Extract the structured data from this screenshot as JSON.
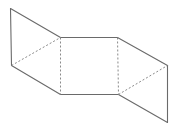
{
  "diagram": {
    "type": "folded-panels-3d",
    "width": 172,
    "height": 126,
    "colors": {
      "background": "#ffffff",
      "solid_stroke": "#6a6a6a",
      "dashed_stroke": "#8a8a8a"
    },
    "vertices": {
      "A": [
        10,
        8
      ],
      "B": [
        11,
        65
      ],
      "C": [
        60,
        37
      ],
      "D": [
        60,
        94
      ],
      "E": [
        117,
        37
      ],
      "F": [
        118,
        94
      ],
      "G": [
        167,
        65
      ],
      "H": [
        167,
        122
      ]
    },
    "solid_edges": [
      [
        "A",
        "B"
      ],
      [
        "A",
        "C"
      ],
      [
        "B",
        "D"
      ],
      [
        "C",
        "E"
      ],
      [
        "D",
        "F"
      ],
      [
        "E",
        "G"
      ],
      [
        "F",
        "H"
      ],
      [
        "G",
        "H"
      ]
    ],
    "dashed_edges": [
      [
        "B",
        "C"
      ],
      [
        "C",
        "D"
      ],
      [
        "E",
        "F"
      ],
      [
        "F",
        "G"
      ]
    ],
    "panels": [
      {
        "name": "left-panel",
        "vertices": [
          "A",
          "C",
          "D",
          "B"
        ]
      },
      {
        "name": "center-panel",
        "vertices": [
          "C",
          "E",
          "F",
          "D"
        ]
      },
      {
        "name": "right-panel",
        "vertices": [
          "E",
          "G",
          "H",
          "F"
        ]
      }
    ]
  }
}
